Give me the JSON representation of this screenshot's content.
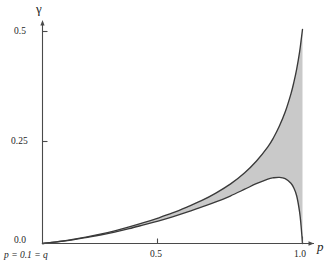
{
  "figure": {
    "background": "#ffffff",
    "curve_color": "#3a3a3a",
    "fill_color": "#c9c9c9",
    "axis_color": "#4a4a4a"
  },
  "axes": {
    "y_label": "γ",
    "x_label": "p",
    "y_ticks": [
      {
        "value": 0.5,
        "label": "0.5"
      },
      {
        "value": 0.25,
        "label": "0.25"
      },
      {
        "value": 0.0,
        "label": "0.0"
      }
    ],
    "x_ticks": [
      {
        "value": 0.5,
        "label": "0.5"
      },
      {
        "value": 1.0,
        "label": "1.0"
      }
    ],
    "origin_note": "p = 0.1 = q"
  },
  "chart_data": {
    "type": "area",
    "title": "",
    "xlabel": "p",
    "ylabel": "γ",
    "xlim": [
      0.1,
      1.0
    ],
    "ylim": [
      0.0,
      0.52
    ],
    "grid": false,
    "legend": "none",
    "annotations": [
      {
        "text": "p = 0.1 = q",
        "position": "below-origin"
      }
    ],
    "x": [
      0.1,
      0.15,
      0.2,
      0.25,
      0.3,
      0.35,
      0.4,
      0.45,
      0.5,
      0.55,
      0.6,
      0.65,
      0.7,
      0.75,
      0.8,
      0.84,
      0.88,
      0.9,
      0.92,
      0.94,
      0.96,
      0.97,
      0.98,
      0.99,
      0.995,
      1.0
    ],
    "series": [
      {
        "name": "upper bound",
        "values": [
          0.0,
          0.004,
          0.009,
          0.015,
          0.022,
          0.03,
          0.039,
          0.049,
          0.06,
          0.072,
          0.086,
          0.101,
          0.119,
          0.14,
          0.167,
          0.194,
          0.228,
          0.25,
          0.277,
          0.31,
          0.353,
          0.38,
          0.412,
          0.452,
          0.478,
          0.505
        ]
      },
      {
        "name": "lower bound",
        "values": [
          0.0,
          0.004,
          0.008,
          0.014,
          0.02,
          0.027,
          0.035,
          0.044,
          0.053,
          0.063,
          0.074,
          0.086,
          0.098,
          0.112,
          0.128,
          0.141,
          0.152,
          0.155,
          0.156,
          0.153,
          0.142,
          0.131,
          0.112,
          0.074,
          0.042,
          0.0
        ]
      }
    ],
    "fill_between": [
      "upper bound",
      "lower bound"
    ]
  }
}
